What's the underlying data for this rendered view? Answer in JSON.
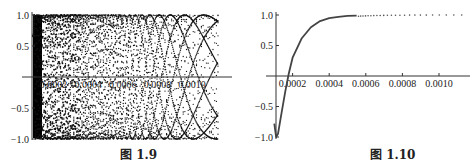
{
  "chart_data": [
    {
      "type": "scatter",
      "title": "",
      "caption": "图 1.9",
      "xlabel": "",
      "ylabel": "",
      "xlim": [
        0.0,
        0.00115
      ],
      "ylim": [
        -1.0,
        1.0
      ],
      "x_ticks": [
        "0.0002",
        "0.0004",
        "0.0006",
        "0.0008",
        "0.0010"
      ],
      "y_ticks": [
        "1.0",
        "0.5",
        "-0.5",
        "-1.0"
      ],
      "grid": false,
      "legend": null,
      "description": "Dense point plot of a rapidly oscillating function between -1 and 1; points form interference/moire patterns that are solid black near x=0 and become sparse toward x=0.0011",
      "series": [
        {
          "name": "oscillating points",
          "amplitude": 1.0,
          "x_range": [
            0.0,
            0.00115
          ],
          "density": "very high near 0, decreasing with x"
        }
      ]
    },
    {
      "type": "scatter",
      "title": "",
      "caption": "图 1.10",
      "xlabel": "",
      "ylabel": "",
      "xlim": [
        0.0001,
        0.00115
      ],
      "ylim": [
        -1.0,
        1.0
      ],
      "x_ticks": [
        "0.0002",
        "0.0004",
        "0.0006",
        "0.0008",
        "0.0010"
      ],
      "y_ticks": [
        "1.0",
        "0.5",
        "-0.5",
        "-1.0"
      ],
      "grid": false,
      "legend": null,
      "series": [
        {
          "name": "curve",
          "x": [
            0.0001,
            0.00011,
            0.00012,
            0.00014,
            0.00016,
            0.00018,
            0.0002,
            0.00025,
            0.0003,
            0.00035,
            0.0004,
            0.00045,
            0.0005,
            0.00055,
            0.0006,
            0.0007,
            0.0008,
            0.0009,
            0.001,
            0.0011
          ],
          "y": [
            -0.78,
            -1.0,
            -0.95,
            -0.6,
            -0.25,
            0.05,
            0.3,
            0.62,
            0.8,
            0.9,
            0.95,
            0.97,
            0.985,
            0.99,
            0.995,
            0.997,
            0.998,
            0.999,
            0.999,
            0.999
          ]
        }
      ]
    }
  ],
  "captions": {
    "left": "图 1.9",
    "right": "图 1.10"
  }
}
